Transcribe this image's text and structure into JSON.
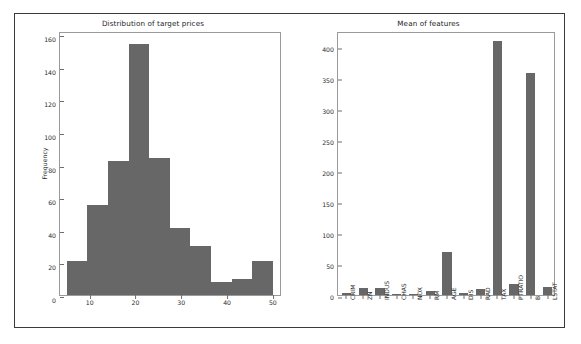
{
  "figure": {
    "background": "#ffffff",
    "frame_color": "#3a3a3a",
    "bar_color": "#676767",
    "axes_edge_color": "#9a9a9a"
  },
  "chart_data": [
    {
      "id": "target-price-histogram",
      "type": "bar",
      "title": "Distribution of target prices",
      "xlabel": "",
      "ylabel": "Frequency",
      "xlim": [
        3.5,
        52
      ],
      "ylim": [
        0,
        162
      ],
      "grid": false,
      "legend": null,
      "xticks": [
        10,
        20,
        30,
        40,
        50
      ],
      "yticks": [
        0,
        20,
        40,
        60,
        80,
        100,
        120,
        140,
        160
      ],
      "bin_edges": [
        5,
        9.5,
        14,
        18.5,
        23,
        27.5,
        32,
        36.5,
        41,
        45.5,
        50
      ],
      "categories": [
        "5-9.5",
        "9.5-14",
        "14-18.5",
        "18.5-23",
        "23-27.5",
        "27.5-32",
        "32-36.5",
        "36.5-41",
        "41-45.5",
        "45.5-50"
      ],
      "values": [
        21,
        55,
        82,
        154,
        84,
        41,
        30,
        8,
        10,
        21
      ]
    },
    {
      "id": "feature-means-bar",
      "type": "bar",
      "title": "Mean of features",
      "xlabel": "",
      "ylabel": "",
      "xlim": [
        -0.6,
        12.6
      ],
      "ylim": [
        0,
        425
      ],
      "grid": false,
      "legend": null,
      "yticks": [
        0,
        50,
        100,
        150,
        200,
        250,
        300,
        350,
        400
      ],
      "categories": [
        "CRIM",
        "ZN",
        "INDUS",
        "CHAS",
        "NOX",
        "RM",
        "AGE",
        "DIS",
        "RAD",
        "TAX",
        "PTRATIO",
        "B",
        "LSTAT"
      ],
      "values": [
        3.6,
        11.4,
        11.1,
        0.07,
        0.55,
        6.3,
        68.6,
        3.8,
        9.5,
        408.2,
        18.5,
        356.7,
        12.7
      ]
    }
  ]
}
